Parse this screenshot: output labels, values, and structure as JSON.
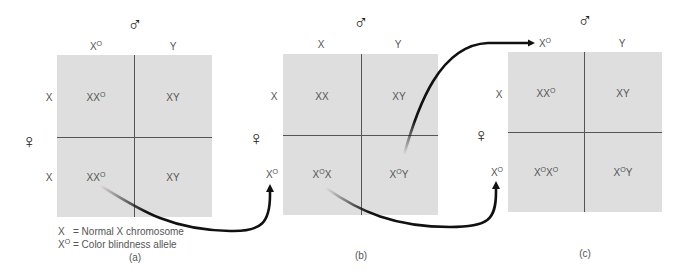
{
  "figure": "Punnett squares showing inheritance of color blindness (X-linked)",
  "male_symbol": "♂",
  "female_symbol": "♀",
  "panels": [
    {
      "id": "a",
      "caption": "(a)",
      "male_gametes": [
        {
          "base": "X",
          "sup": "O"
        },
        {
          "base": "Y",
          "sup": ""
        }
      ],
      "female_gametes": [
        {
          "base": "X",
          "sup": ""
        },
        {
          "base": "X",
          "sup": ""
        }
      ],
      "cells": [
        [
          {
            "parts": [
              {
                "b": "X",
                "s": ""
              },
              {
                "b": "X",
                "s": "O"
              }
            ]
          },
          {
            "parts": [
              {
                "b": "XY",
                "s": ""
              }
            ]
          }
        ],
        [
          {
            "parts": [
              {
                "b": "X",
                "s": ""
              },
              {
                "b": "X",
                "s": "O"
              }
            ]
          },
          {
            "parts": [
              {
                "b": "XY",
                "s": ""
              }
            ]
          }
        ]
      ]
    },
    {
      "id": "b",
      "caption": "(b)",
      "male_gametes": [
        {
          "base": "X",
          "sup": ""
        },
        {
          "base": "Y",
          "sup": ""
        }
      ],
      "female_gametes": [
        {
          "base": "X",
          "sup": ""
        },
        {
          "base": "X",
          "sup": "O"
        }
      ],
      "cells": [
        [
          {
            "parts": [
              {
                "b": "XX",
                "s": ""
              }
            ]
          },
          {
            "parts": [
              {
                "b": "XY",
                "s": ""
              }
            ]
          }
        ],
        [
          {
            "parts": [
              {
                "b": "X",
                "s": "O"
              },
              {
                "b": "X",
                "s": ""
              }
            ]
          },
          {
            "parts": [
              {
                "b": "X",
                "s": "O"
              },
              {
                "b": "Y",
                "s": ""
              }
            ]
          }
        ]
      ]
    },
    {
      "id": "c",
      "caption": "(c)",
      "male_gametes": [
        {
          "base": "X",
          "sup": "O"
        },
        {
          "base": "Y",
          "sup": ""
        }
      ],
      "female_gametes": [
        {
          "base": "X",
          "sup": ""
        },
        {
          "base": "X",
          "sup": "O"
        }
      ],
      "cells": [
        [
          {
            "parts": [
              {
                "b": "X",
                "s": ""
              },
              {
                "b": "X",
                "s": "O"
              }
            ]
          },
          {
            "parts": [
              {
                "b": "XY",
                "s": ""
              }
            ]
          }
        ],
        [
          {
            "parts": [
              {
                "b": "X",
                "s": "O"
              },
              {
                "b": "X",
                "s": "O"
              }
            ]
          },
          {
            "parts": [
              {
                "b": "X",
                "s": "O"
              },
              {
                "b": "Y",
                "s": ""
              }
            ]
          }
        ]
      ]
    }
  ],
  "legend": {
    "line1": {
      "symbol": "X",
      "sup": "",
      "text": "= Normal X chromosome"
    },
    "line2": {
      "symbol": "X",
      "sup": "O",
      "text": "= Color blindness allele"
    }
  },
  "arrows": [
    {
      "from": "a: bottom-left cell (XX^O)",
      "to": "b: female gamete X^O"
    },
    {
      "from": "b: bottom-right cell (X^OY)",
      "to": "c: male gamete X^O"
    },
    {
      "from": "b: bottom-left cell (X^OX)",
      "to": "c: female gamete X^O"
    }
  ],
  "colors": {
    "grid_fill": "#dedede",
    "grid_line": "#555555",
    "text": "#555555",
    "arrow": "#111111"
  }
}
